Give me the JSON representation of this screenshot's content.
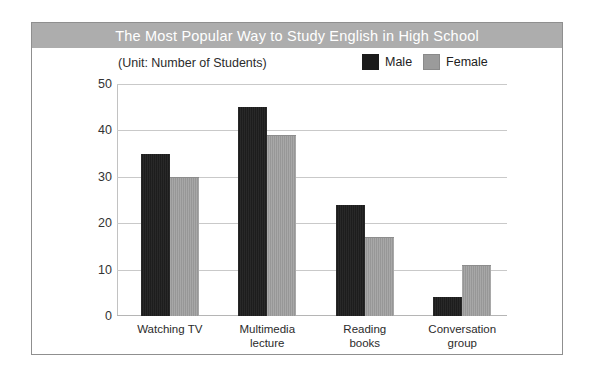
{
  "card": {
    "title": "The Most Popular Way to Study English in High School",
    "unit_label": "(Unit: Number of Students)"
  },
  "legend": {
    "items": [
      {
        "label": "Male",
        "color": "#1b1b1b",
        "swatch": "male-swatch"
      },
      {
        "label": "Female",
        "color": "#9b9b9b",
        "swatch": "female-swatch"
      }
    ]
  },
  "axis": {
    "yticks": [
      "50",
      "40",
      "30",
      "20",
      "10",
      "0"
    ]
  },
  "chart_data": {
    "type": "bar",
    "title": "The Most Popular Way to Study English in High School",
    "subtitle": "(Unit: Number of Students)",
    "xlabel": "",
    "ylabel": "Number of Students",
    "ylim": [
      0,
      50
    ],
    "ytick_step": 10,
    "grid": true,
    "legend_position": "top-right",
    "categories": [
      "Watching TV",
      "Multimedia\nlecture",
      "Reading\nbooks",
      "Conversation\ngroup"
    ],
    "series": [
      {
        "name": "Male",
        "color": "#1b1b1b",
        "values": [
          35,
          45,
          24,
          4
        ]
      },
      {
        "name": "Female",
        "color": "#9b9b9b",
        "values": [
          30,
          39,
          17,
          11
        ]
      }
    ]
  }
}
